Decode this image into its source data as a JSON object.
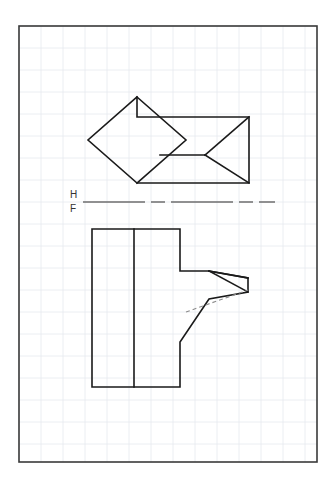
{
  "sheet": {
    "width": 336,
    "height": 489,
    "background_color": "#ffffff",
    "title": "Orthographic Projection Worksheet"
  },
  "grid": {
    "description": "light blue-grey graph paper grid",
    "color": "#e6eaef",
    "minor_spacing": 22,
    "stroke_width": 0.8,
    "origin_x": 19,
    "origin_y": 26
  },
  "border": {
    "name": "sheet-border",
    "color": "#3a3a3a",
    "stroke_width": 1.6,
    "x": 19,
    "y": 26,
    "width": 298,
    "height": 436
  },
  "fold_line": {
    "name": "hf-fold-line",
    "label_top": "H",
    "label_bottom": "F",
    "color": "#6f6f6f",
    "stroke_width": 1.4,
    "dash_pattern": "62 6 14 6",
    "x1": 83,
    "x2": 275,
    "y": 202,
    "label_x": 70,
    "label_top_y": 198,
    "label_bottom_y": 212
  },
  "style": {
    "visible_line_color": "#1a1a1a",
    "visible_line_width": 1.6,
    "hidden_line_color": "#8c8c8c",
    "hidden_line_width": 1.1,
    "hidden_dash_pattern": "4 3"
  },
  "views": [
    {
      "name": "top-view",
      "label": "Top view (H) — diamond joined to rectangle with notch",
      "polylines": [
        {
          "name": "top-view-outline",
          "points": "137,97 88,140 137,183 249,183 249,117 137,117 137,97",
          "closed": false
        },
        {
          "name": "top-view-diamond-right-edge",
          "points": "137,97 186,140 137,183"
        },
        {
          "name": "top-view-notch-upper",
          "points": "249,117 205,155"
        },
        {
          "name": "top-view-notch-lower",
          "points": "205,155 249,183"
        },
        {
          "name": "top-view-mid-horizontal",
          "points": "160,155 205,155"
        }
      ]
    },
    {
      "name": "front-view",
      "label": "Front view (F) — tall rectangle with arrow-shaped projection",
      "polylines": [
        {
          "name": "front-view-outline",
          "points": "92,229 180,229 180,271 209,271 248,278 248,292 209,299 180,342 180,387 92,387 92,229",
          "closed": true
        },
        {
          "name": "front-view-vertical-divider",
          "points": "134,229 134,387"
        },
        {
          "name": "front-view-arrow-upper-chord",
          "points": "209,271 248,292"
        },
        {
          "name": "front-view-arrow-lower-chord",
          "points": "209,271 248,278"
        }
      ],
      "hidden_lines": [
        {
          "name": "front-view-hidden-edge",
          "points": "186,312 248,290"
        }
      ]
    }
  ]
}
